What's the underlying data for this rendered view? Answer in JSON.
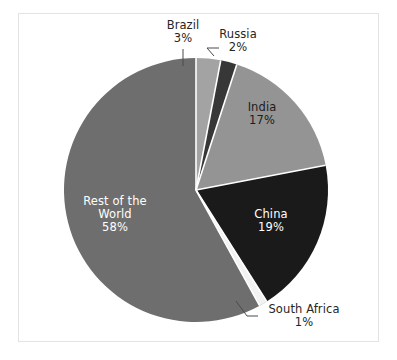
{
  "chart_data": {
    "type": "pie",
    "title": "",
    "subtitle": "",
    "xlabel": "",
    "ylabel": "",
    "grid": false,
    "legend_position": "none",
    "labels_show_percent": true,
    "start_angle_deg": 0,
    "direction": "clockwise",
    "categories": [
      "Brazil",
      "Russia",
      "India",
      "China",
      "South Africa",
      "Rest of the World"
    ],
    "values": [
      3,
      2,
      17,
      19,
      1,
      58
    ],
    "units": "percent",
    "slices": [
      {
        "name": "Brazil",
        "value": 3,
        "value_label": "3%",
        "color": "#a3a3a3",
        "label_placement": "outside",
        "label_text_color": "#262626",
        "leader_line": true
      },
      {
        "name": "Russia",
        "value": 2,
        "value_label": "2%",
        "color": "#373737",
        "label_placement": "outside",
        "label_text_color": "#262626",
        "leader_line": true
      },
      {
        "name": "India",
        "value": 17,
        "value_label": "17%",
        "color": "#949494",
        "label_placement": "inside",
        "label_text_color": "#1c1c1c",
        "leader_line": false
      },
      {
        "name": "China",
        "value": 19,
        "value_label": "19%",
        "color": "#1a1a1a",
        "label_placement": "inside",
        "label_text_color": "#ffffff",
        "leader_line": false
      },
      {
        "name": "South Africa",
        "value": 1,
        "value_label": "1%",
        "color": "#f2f2f2",
        "label_placement": "outside",
        "label_text_color": "#262626",
        "leader_line": true
      },
      {
        "name": "Rest of the World",
        "value": 58,
        "value_label": "58%",
        "color": "#6e6e6e",
        "label_placement": "inside",
        "label_text_color": "#ffffff",
        "leader_line": false
      }
    ]
  },
  "labels": {
    "brazil": {
      "name": "Brazil",
      "percent": "3%"
    },
    "russia": {
      "name": "Russia",
      "percent": "2%"
    },
    "india": {
      "name": "India",
      "percent": "17%"
    },
    "china": {
      "name": "China",
      "percent": "19%"
    },
    "south_africa": {
      "name": "South Africa",
      "percent": "1%"
    },
    "rest_of_world": {
      "line1": "Rest of the",
      "line2": "World",
      "percent": "58%"
    }
  },
  "style": {
    "plot_background": "#ffffff",
    "frame_border_color": "#e3e3e3",
    "slice_gap_color": "#ffffff"
  }
}
